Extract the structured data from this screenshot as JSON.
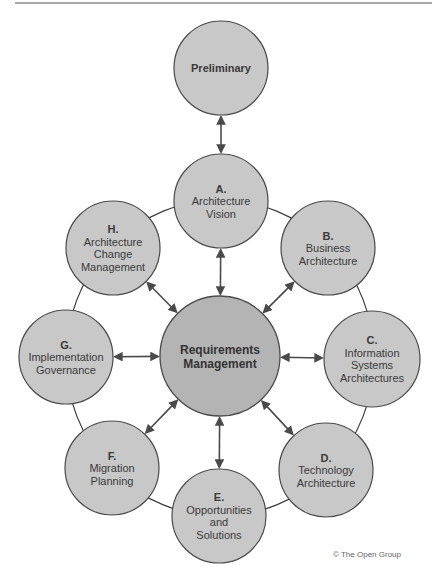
{
  "colors": {
    "phase_fill": "#c8c8c8",
    "center_fill": "#b4b4b4",
    "stroke": "#4a4a4a",
    "ring": "#3c3c3c",
    "arrow": "#4a4a4a",
    "rule": "#555555"
  },
  "preliminary": {
    "label": "Preliminary",
    "cx": 221,
    "cy": 68,
    "r": 47
  },
  "center": {
    "line1": "Requirements",
    "line2": "Management",
    "cx": 220,
    "cy": 356,
    "r": 60
  },
  "phases": [
    {
      "id": "A",
      "letter": "A.",
      "lines": [
        "Architecture",
        "Vision"
      ],
      "cx": 221,
      "cy": 201,
      "r": 47
    },
    {
      "id": "B",
      "letter": "B.",
      "lines": [
        "Business",
        "Architecture"
      ],
      "cx": 328,
      "cy": 248,
      "r": 47
    },
    {
      "id": "C",
      "letter": "C.",
      "lines": [
        "Information",
        "Systems",
        "Architectures"
      ],
      "cx": 372,
      "cy": 359,
      "r": 48
    },
    {
      "id": "D",
      "letter": "D.",
      "lines": [
        "Technology",
        "Architecture"
      ],
      "cx": 326,
      "cy": 470,
      "r": 47
    },
    {
      "id": "E",
      "letter": "E.",
      "lines": [
        "Opportunities",
        "and",
        "Solutions"
      ],
      "cx": 219,
      "cy": 516,
      "r": 47
    },
    {
      "id": "F",
      "letter": "F.",
      "lines": [
        "Migration",
        "Planning"
      ],
      "cx": 112,
      "cy": 468,
      "r": 47
    },
    {
      "id": "G",
      "letter": "G.",
      "lines": [
        "Implementation",
        "Governance"
      ],
      "cx": 66,
      "cy": 357,
      "r": 47
    },
    {
      "id": "H",
      "letter": "H.",
      "lines": [
        "Architecture",
        "Change",
        "Management"
      ],
      "cx": 113,
      "cy": 248,
      "r": 47
    }
  ],
  "copyright": "© The Open Group",
  "icons": {
    "arrow": "double-headed-arrow"
  }
}
